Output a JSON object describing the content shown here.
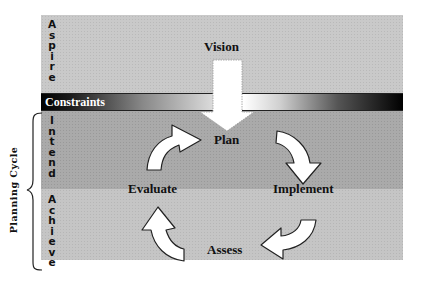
{
  "header": {
    "clipped_text": "˙  ˙  ˙ ˙"
  },
  "bands": {
    "aspire": {
      "label": "Aspire",
      "color": "#c9c9c9"
    },
    "constraints": {
      "label": "Constraints"
    },
    "intend": {
      "label": "Intend",
      "color": "#aaaaaa"
    },
    "achieve": {
      "label": "Achieve",
      "color": "#c5c5c5"
    }
  },
  "group": {
    "label": "Planning Cycle"
  },
  "nodes": {
    "vision": "Vision",
    "plan": "Plan",
    "implement": "Implement",
    "assess": "Assess",
    "evaluate": "Evaluate"
  },
  "edges": [
    {
      "from": "Vision",
      "to": "Plan",
      "icon": "down-arrow-icon"
    },
    {
      "from": "Plan",
      "to": "Implement",
      "icon": "curved-arrow-icon"
    },
    {
      "from": "Implement",
      "to": "Assess",
      "icon": "curved-arrow-icon"
    },
    {
      "from": "Assess",
      "to": "Evaluate",
      "icon": "curved-arrow-icon"
    },
    {
      "from": "Evaluate",
      "to": "Plan",
      "icon": "curved-arrow-icon"
    }
  ]
}
